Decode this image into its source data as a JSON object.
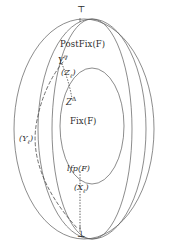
{
  "figure": {
    "background": "#ffffff",
    "stroke_color": "#555555",
    "text_color": "#2b2b2b"
  },
  "labels": {
    "top_element": "⊤",
    "bottom_element": "⊥",
    "postfix": "PostFix(F)",
    "fix": "Fix(F)",
    "lfp": "lfp(F)",
    "y_nabla_base": "Y",
    "y_nabla_sup": "∇",
    "z_delta_base": "Z",
    "z_delta_sup": "Δ",
    "z_sequence_open": "(Z",
    "z_sequence_sub": "ℓ",
    "z_sequence_close": ")",
    "y_sequence_open": "(Y",
    "y_sequence_sub": "ℓ",
    "y_sequence_close": ")",
    "x_sequence_open": "(X",
    "x_sequence_sub": "ℓ",
    "x_sequence_close": ")"
  },
  "regions": [
    {
      "name": "lattice-outer-ellipse",
      "label": ""
    },
    {
      "name": "postfix-ellipse",
      "label": "PostFix(F)"
    },
    {
      "name": "fix-ellipse",
      "label": "Fix(F)"
    }
  ],
  "paths": [
    {
      "name": "y-sequence-dashed-path",
      "style": "dashed",
      "from": "Y∇",
      "to": "⊥"
    },
    {
      "name": "z-sequence-dotted-path",
      "style": "dotted",
      "from": "(Zℓ)",
      "to": "ZΔ"
    },
    {
      "name": "x-sequence-dotted-path",
      "style": "dotted",
      "from": "lfp(F)",
      "to": "⊥"
    }
  ]
}
